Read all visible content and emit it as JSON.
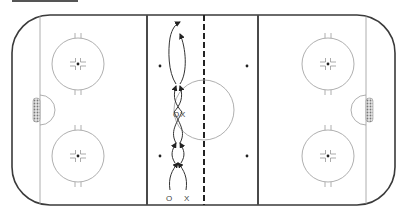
{
  "diagram": {
    "type": "hockey-rink-drill",
    "colors": {
      "boards": "#3a3a3a",
      "blue_line": "#4a4a4a",
      "center_line": "#222222",
      "markings": "#9a9a9a",
      "drill_path": "#333333",
      "goal_fill": "#bbbbbb",
      "header_bar": "#555555"
    },
    "players": [
      {
        "id": "p1-start",
        "symbol": "O"
      },
      {
        "id": "p2-start",
        "symbol": "X"
      },
      {
        "id": "p1-mid",
        "symbol": "O"
      },
      {
        "id": "p2-mid",
        "symbol": "X"
      }
    ],
    "zones": [
      "defensive-zone",
      "neutral-zone",
      "offensive-zone"
    ],
    "drill": {
      "description": "Two players (O and X) skate weaving crossover paths up the neutral zone, crossing at center ice, finishing with loops at the top.",
      "segments": 4
    }
  }
}
